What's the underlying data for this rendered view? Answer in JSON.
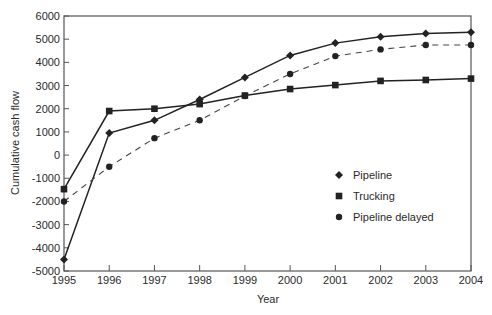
{
  "chart_data": {
    "type": "line",
    "title": "",
    "xlabel": "Year",
    "ylabel": "Cumulative cash flow",
    "x": [
      1995,
      1996,
      1997,
      1998,
      1999,
      2000,
      2001,
      2002,
      2003,
      2004
    ],
    "xticks": [
      "1995",
      "1996",
      "1997",
      "1998",
      "1999",
      "2000",
      "2001",
      "2002",
      "2003",
      "2004"
    ],
    "yticks": [
      "6000",
      "5000",
      "4000",
      "3000",
      "2000",
      "1000",
      "0",
      "-1000",
      "-2000",
      "-3000",
      "-4000",
      "-5000"
    ],
    "ylim": [
      -5000,
      6000
    ],
    "xlim": [
      1995,
      2004
    ],
    "grid": false,
    "legend_position": "inside-right",
    "series": [
      {
        "name": "Pipeline",
        "marker": "diamond",
        "line": "solid",
        "values": [
          -4500,
          950,
          1500,
          2400,
          3350,
          4300,
          4830,
          5100,
          5250,
          5300
        ]
      },
      {
        "name": "Trucking",
        "marker": "square",
        "line": "solid",
        "values": [
          -1470,
          1900,
          2000,
          2200,
          2570,
          2850,
          3020,
          3200,
          3240,
          3300
        ]
      },
      {
        "name": "Pipeline delayed",
        "marker": "circle",
        "line": "dashed",
        "values": [
          -2000,
          -500,
          730,
          1500,
          2550,
          3500,
          4270,
          4560,
          4750,
          4750
        ]
      }
    ]
  },
  "colors": {
    "line": "#222222",
    "axis": "#555555",
    "text": "#2a2a2a"
  }
}
